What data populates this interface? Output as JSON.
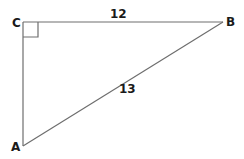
{
  "diagram": {
    "type": "right-triangle",
    "colors": {
      "line": "#6e6e6e",
      "text": "#1a1a1a",
      "background": "#ffffff"
    },
    "vertices": [
      {
        "name": "C",
        "x": 23,
        "y": 22,
        "label": "C"
      },
      {
        "name": "B",
        "x": 223,
        "y": 22,
        "label": "B"
      },
      {
        "name": "A",
        "x": 23,
        "y": 146,
        "label": "A"
      }
    ],
    "sides": [
      {
        "from": "C",
        "to": "B",
        "length_label": "12"
      },
      {
        "from": "B",
        "to": "A",
        "length_label": "13"
      },
      {
        "from": "C",
        "to": "A",
        "length_label": ""
      }
    ],
    "right_angle_at": "C"
  }
}
